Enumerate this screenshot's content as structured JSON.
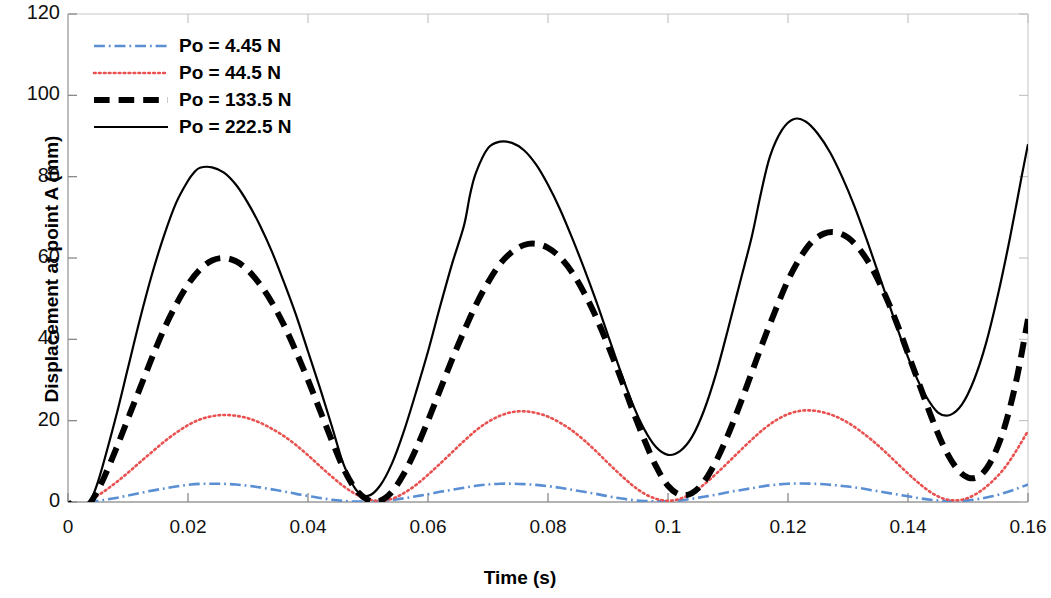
{
  "chart_data": {
    "type": "line",
    "title": "",
    "xlabel": "Time (s)",
    "ylabel": "Displacement at point A (mm)",
    "xlim": [
      0,
      0.16
    ],
    "ylim": [
      0,
      120
    ],
    "xticks": [
      "0",
      "0.02",
      "0.04",
      "0.06",
      "0.08",
      "0.1",
      "0.12",
      "0.14",
      "0.16"
    ],
    "xtick_values": [
      0,
      0.02,
      0.04,
      0.06,
      0.08,
      0.1,
      0.12,
      0.14,
      0.16
    ],
    "yticks": [
      "0",
      "20",
      "40",
      "60",
      "80",
      "100",
      "120"
    ],
    "ytick_values": [
      0,
      20,
      40,
      60,
      80,
      100,
      120
    ],
    "grid": false,
    "legend_position": "top-left",
    "series": [
      {
        "name": "Po = 4.45 N",
        "color": "#5b8fd4",
        "style": "dash-dot",
        "width": 2.6,
        "x": [
          0,
          0.001,
          0.002,
          0.003,
          0.004,
          0.006,
          0.008,
          0.01,
          0.012,
          0.014,
          0.016,
          0.018,
          0.02,
          0.022,
          0.024,
          0.026,
          0.028,
          0.03,
          0.032,
          0.034,
          0.036,
          0.038,
          0.04,
          0.042,
          0.044,
          0.046,
          0.048,
          0.05,
          0.052,
          0.054,
          0.056,
          0.058,
          0.06,
          0.062,
          0.064,
          0.066,
          0.068,
          0.07,
          0.072,
          0.074,
          0.076,
          0.078,
          0.08,
          0.082,
          0.084,
          0.086,
          0.088,
          0.09,
          0.092,
          0.094,
          0.096,
          0.098,
          0.1,
          0.102,
          0.104,
          0.106,
          0.108,
          0.11,
          0.112,
          0.114,
          0.116,
          0.118,
          0.12,
          0.122,
          0.124,
          0.126,
          0.128,
          0.13,
          0.132,
          0.134,
          0.136,
          0.138,
          0.14,
          0.142,
          0.144,
          0.146,
          0.148,
          0.15,
          0.152,
          0.154,
          0.156,
          0.158,
          0.16
        ],
        "y": [
          0,
          -0.4,
          -0.8,
          -0.5,
          0.0,
          0.5,
          1.0,
          1.6,
          2.2,
          2.8,
          3.3,
          3.8,
          4.2,
          4.45,
          4.5,
          4.45,
          4.3,
          4.0,
          3.6,
          3.1,
          2.6,
          2.0,
          1.5,
          1.0,
          0.55,
          0.25,
          0.1,
          0.1,
          0.25,
          0.5,
          0.9,
          1.4,
          1.9,
          2.5,
          3.0,
          3.5,
          4.0,
          4.3,
          4.5,
          4.5,
          4.4,
          4.2,
          3.9,
          3.5,
          3.0,
          2.5,
          2.0,
          1.4,
          0.9,
          0.5,
          0.25,
          0.15,
          0.2,
          0.4,
          0.8,
          1.3,
          1.8,
          2.4,
          2.9,
          3.4,
          3.9,
          4.25,
          4.5,
          4.55,
          4.5,
          4.35,
          4.1,
          3.8,
          3.4,
          2.9,
          2.4,
          1.9,
          1.4,
          0.9,
          0.5,
          0.3,
          0.25,
          0.4,
          0.8,
          1.4,
          2.2,
          3.2,
          4.3
        ]
      },
      {
        "name": "Po = 44.5 N",
        "color": "#e8514f",
        "style": "dotted",
        "width": 2.6,
        "x": [
          0,
          0.001,
          0.002,
          0.003,
          0.004,
          0.006,
          0.008,
          0.01,
          0.012,
          0.014,
          0.016,
          0.018,
          0.02,
          0.022,
          0.024,
          0.026,
          0.028,
          0.03,
          0.032,
          0.034,
          0.036,
          0.038,
          0.04,
          0.042,
          0.044,
          0.046,
          0.048,
          0.05,
          0.052,
          0.054,
          0.056,
          0.058,
          0.06,
          0.062,
          0.064,
          0.066,
          0.068,
          0.07,
          0.072,
          0.074,
          0.076,
          0.078,
          0.08,
          0.082,
          0.084,
          0.086,
          0.088,
          0.09,
          0.092,
          0.094,
          0.096,
          0.098,
          0.1,
          0.102,
          0.104,
          0.106,
          0.108,
          0.11,
          0.112,
          0.114,
          0.116,
          0.118,
          0.12,
          0.122,
          0.124,
          0.126,
          0.128,
          0.13,
          0.132,
          0.134,
          0.136,
          0.138,
          0.14,
          0.142,
          0.144,
          0.146,
          0.148,
          0.15,
          0.152,
          0.154,
          0.156,
          0.158,
          0.16
        ],
        "y": [
          0,
          -1.0,
          -1.6,
          -0.8,
          0.6,
          2.6,
          4.8,
          7.2,
          9.8,
          12.3,
          14.8,
          17.0,
          18.9,
          20.3,
          21.1,
          21.4,
          21.2,
          20.6,
          19.5,
          18.0,
          16.2,
          14.0,
          11.5,
          8.8,
          6.2,
          3.8,
          1.9,
          0.7,
          0.3,
          0.8,
          2.2,
          4.2,
          6.7,
          9.4,
          12.2,
          15.0,
          17.6,
          19.7,
          21.2,
          22.1,
          22.3,
          21.9,
          21.0,
          19.5,
          17.6,
          15.2,
          12.5,
          9.6,
          6.8,
          4.2,
          2.1,
          0.8,
          0.3,
          0.8,
          2.2,
          4.3,
          6.9,
          9.7,
          12.6,
          15.4,
          18.0,
          20.1,
          21.6,
          22.4,
          22.5,
          22.0,
          21.0,
          19.5,
          17.5,
          15.2,
          12.6,
          9.8,
          7.0,
          4.4,
          2.2,
          0.8,
          0.4,
          1.0,
          2.6,
          5.0,
          8.2,
          12.5,
          17.5
        ]
      },
      {
        "name": "Po = 133.5 N",
        "color": "#000000",
        "style": "dashed",
        "width": 6.0,
        "x": [
          0,
          0.001,
          0.002,
          0.003,
          0.004,
          0.005,
          0.006,
          0.008,
          0.01,
          0.012,
          0.014,
          0.016,
          0.018,
          0.02,
          0.022,
          0.024,
          0.026,
          0.028,
          0.03,
          0.032,
          0.034,
          0.036,
          0.038,
          0.04,
          0.042,
          0.044,
          0.046,
          0.048,
          0.05,
          0.052,
          0.054,
          0.056,
          0.058,
          0.06,
          0.062,
          0.064,
          0.066,
          0.068,
          0.07,
          0.072,
          0.074,
          0.076,
          0.078,
          0.08,
          0.082,
          0.084,
          0.086,
          0.088,
          0.09,
          0.092,
          0.094,
          0.096,
          0.098,
          0.1,
          0.102,
          0.104,
          0.106,
          0.108,
          0.11,
          0.112,
          0.114,
          0.116,
          0.118,
          0.12,
          0.122,
          0.124,
          0.126,
          0.128,
          0.13,
          0.132,
          0.134,
          0.136,
          0.138,
          0.14,
          0.142,
          0.144,
          0.146,
          0.148,
          0.15,
          0.152,
          0.154,
          0.156,
          0.158,
          0.16
        ],
        "y": [
          0,
          -1.6,
          -2.0,
          -1.4,
          0.4,
          3.0,
          6.0,
          13.0,
          20.5,
          28.0,
          35.5,
          42.5,
          48.5,
          53.5,
          57.2,
          59.4,
          60.0,
          59.2,
          57.0,
          53.5,
          49.0,
          43.5,
          37.0,
          30.0,
          22.5,
          15.0,
          8.0,
          3.0,
          0.5,
          0.3,
          2.5,
          7.0,
          13.0,
          20.0,
          27.5,
          35.0,
          42.0,
          48.5,
          54.0,
          58.5,
          61.5,
          63.2,
          63.5,
          62.5,
          60.2,
          56.5,
          51.5,
          45.5,
          38.5,
          31.0,
          23.0,
          15.5,
          8.8,
          4.0,
          1.8,
          2.2,
          5.0,
          10.0,
          16.5,
          24.0,
          32.0,
          40.0,
          47.5,
          54.5,
          60.0,
          64.0,
          66.0,
          66.3,
          65.0,
          62.0,
          57.5,
          51.5,
          44.5,
          36.5,
          28.5,
          20.5,
          13.5,
          8.5,
          6.0,
          6.5,
          10.5,
          18.0,
          29.5,
          45.0
        ]
      },
      {
        "name": "Po = 222.5 N",
        "color": "#000000",
        "style": "solid",
        "width": 2.2,
        "x": [
          0,
          0.001,
          0.002,
          0.003,
          0.004,
          0.005,
          0.006,
          0.008,
          0.01,
          0.012,
          0.014,
          0.016,
          0.018,
          0.02,
          0.021,
          0.022,
          0.024,
          0.026,
          0.028,
          0.03,
          0.032,
          0.034,
          0.036,
          0.038,
          0.04,
          0.042,
          0.044,
          0.045,
          0.046,
          0.048,
          0.05,
          0.052,
          0.054,
          0.056,
          0.058,
          0.06,
          0.062,
          0.064,
          0.066,
          0.067,
          0.068,
          0.07,
          0.072,
          0.074,
          0.076,
          0.078,
          0.08,
          0.082,
          0.084,
          0.086,
          0.088,
          0.09,
          0.092,
          0.094,
          0.096,
          0.098,
          0.1,
          0.102,
          0.104,
          0.106,
          0.108,
          0.11,
          0.112,
          0.114,
          0.1155,
          0.117,
          0.119,
          0.121,
          0.123,
          0.125,
          0.127,
          0.129,
          0.131,
          0.133,
          0.135,
          0.137,
          0.139,
          0.141,
          0.143,
          0.145,
          0.147,
          0.149,
          0.151,
          0.153,
          0.155,
          0.157,
          0.159,
          0.16
        ],
        "y": [
          0,
          -2.0,
          -2.4,
          -1.6,
          1.0,
          5.0,
          10.0,
          21.0,
          33.0,
          45.0,
          56.0,
          65.5,
          73.5,
          79.0,
          81.0,
          82.2,
          82.3,
          81.0,
          78.0,
          73.5,
          68.0,
          61.5,
          54.0,
          46.0,
          37.0,
          28.0,
          18.5,
          13.5,
          9.0,
          3.0,
          1.5,
          4.0,
          9.5,
          17.5,
          27.0,
          37.0,
          48.0,
          58.5,
          68.0,
          75.5,
          81.0,
          87.0,
          88.6,
          88.3,
          86.5,
          83.0,
          78.0,
          72.0,
          65.0,
          57.5,
          49.5,
          41.0,
          32.5,
          24.5,
          18.0,
          13.5,
          11.6,
          12.5,
          16.0,
          22.5,
          31.5,
          42.5,
          54.0,
          65.5,
          76.0,
          85.0,
          91.5,
          94.2,
          93.5,
          90.5,
          86.0,
          80.0,
          73.0,
          65.0,
          56.5,
          48.0,
          39.5,
          32.0,
          26.0,
          22.0,
          21.4,
          24.0,
          30.0,
          39.0,
          51.0,
          65.0,
          80.5,
          88.0
        ]
      }
    ]
  },
  "axes": {
    "ylabel": "Displacement at point A (mm)",
    "xlabel": "Time (s)"
  },
  "legend": {
    "items": [
      {
        "label": "Po = 4.45 N"
      },
      {
        "label": "Po = 44.5 N"
      },
      {
        "label": "Po = 133.5 N"
      },
      {
        "label": "Po = 222.5 N"
      }
    ]
  }
}
